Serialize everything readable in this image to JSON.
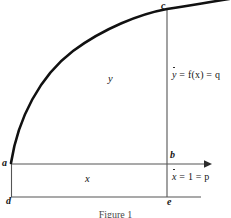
{
  "figure": {
    "caption": "Figure 1",
    "points": {
      "a": "a",
      "b": "b",
      "c": "c",
      "d": "d",
      "e": "e"
    },
    "regions": {
      "vertical_label": "y",
      "horizontal_label": "x"
    },
    "equations": {
      "ydot_var": "y",
      "ydot_rest": " = f(x) = q",
      "xdot_var": "x",
      "xdot_rest": " = 1 = p"
    },
    "colors": {
      "curve": "#111111",
      "axis": "#555555",
      "background": "#ffffff",
      "text": "#141414"
    },
    "geometry": {
      "curve_start_x": 11,
      "curve_start_y": 163,
      "curve_end_x": 228,
      "curve_end_y": 0,
      "point_c_x": 167,
      "point_c_y": 10,
      "baseline_ab_y": 164,
      "baseline_de_y": 197,
      "left_edge_x": 11,
      "vertical_line_x": 167,
      "arrow_tip_x": 212
    }
  }
}
